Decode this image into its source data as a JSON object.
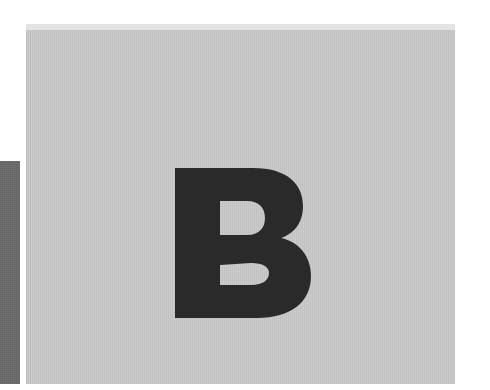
{
  "image": {
    "letter": "B",
    "colors": {
      "background": "#ffffff",
      "panel": "#c9c9c9",
      "top_band": "#e4e4e4",
      "left_strip": "#6a6a6a",
      "letter": "#2a2a2a"
    }
  }
}
